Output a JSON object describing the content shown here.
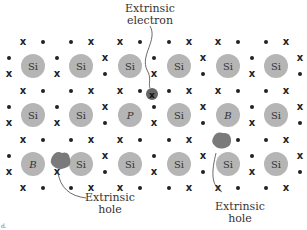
{
  "diagram": {
    "atoms": [
      {
        "label": "Si",
        "x": 33,
        "y": 66
      },
      {
        "label": "Si",
        "x": 81,
        "y": 66
      },
      {
        "label": "Si",
        "x": 130,
        "y": 66
      },
      {
        "label": "Si",
        "x": 179,
        "y": 66
      },
      {
        "label": "Si",
        "x": 228,
        "y": 66
      },
      {
        "label": "Si",
        "x": 276,
        "y": 66
      },
      {
        "label": "Si",
        "x": 33,
        "y": 115
      },
      {
        "label": "Si",
        "x": 81,
        "y": 115
      },
      {
        "label": "P",
        "x": 130,
        "y": 115,
        "italic": true
      },
      {
        "label": "Si",
        "x": 179,
        "y": 115
      },
      {
        "label": "B",
        "x": 228,
        "y": 115,
        "italic": true
      },
      {
        "label": "Si",
        "x": 276,
        "y": 115
      },
      {
        "label": "B",
        "x": 33,
        "y": 164,
        "italic": true
      },
      {
        "label": "Si",
        "x": 81,
        "y": 164
      },
      {
        "label": "Si",
        "x": 130,
        "y": 164
      },
      {
        "label": "Si",
        "x": 179,
        "y": 164
      },
      {
        "label": "Si",
        "x": 228,
        "y": 164
      },
      {
        "label": "Si",
        "x": 276,
        "y": 164
      }
    ],
    "labels": {
      "electron_line1": "Extrinsic",
      "electron_line2": "electron",
      "hole_left_line1": "Extrinsic",
      "hole_left_line2": "hole",
      "hole_right_line1": "Extrinsic",
      "hole_right_line2": "hole"
    },
    "corner_mark": "d.",
    "colors": {
      "atom": "#b5b5b5",
      "hole": "#777777",
      "text": "#333333"
    }
  }
}
